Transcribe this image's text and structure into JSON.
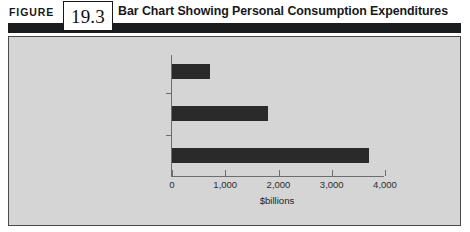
{
  "figure": {
    "label": "FIGURE",
    "number": "19.3",
    "title": "Bar Chart Showing Personal Consumption Expenditures"
  },
  "chart_data": {
    "type": "bar",
    "orientation": "horizontal",
    "title": "Bar Chart Showing Personal Consumption Expenditures",
    "categories": [
      "Durable goods",
      "Nondurable goods",
      "Services"
    ],
    "values": [
      720,
      1800,
      3700
    ],
    "xlabel": "$billions",
    "ylabel": "",
    "xlim": [
      0,
      4000
    ],
    "xticks": [
      0,
      1000,
      2000,
      3000,
      4000
    ],
    "xtick_labels": [
      "0",
      "1,000",
      "2,000",
      "3,000",
      "4,000"
    ],
    "grid": false,
    "legend": false,
    "bar_color": "#2a2a2a",
    "plot_background": "#d5d5d5"
  }
}
